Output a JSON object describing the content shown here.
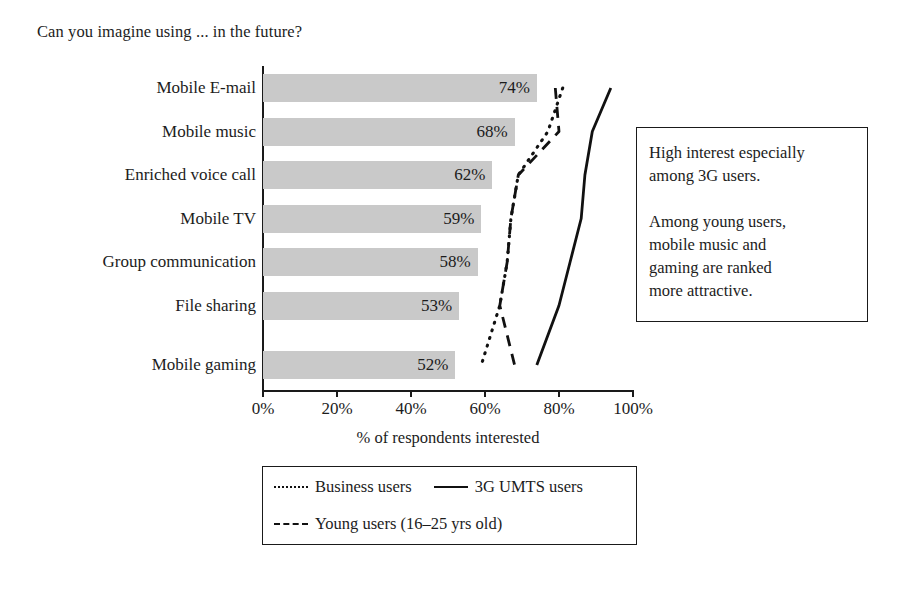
{
  "chart_title": "Can you imagine using ... in the future?",
  "axis": {
    "x_title": "% of respondents interested",
    "x_ticks": [
      "0%",
      "20%",
      "40%",
      "60%",
      "80%",
      "100%"
    ],
    "x_tick_values": [
      0,
      20,
      40,
      60,
      80,
      100
    ]
  },
  "annotation": {
    "paragraph_1": "High interest especially",
    "paragraph_2": "among 3G users.",
    "paragraph_3": "Among young users,",
    "paragraph_4": "mobile music and",
    "paragraph_5": "gaming are ranked",
    "paragraph_6": "more attractive."
  },
  "legend": {
    "items": [
      {
        "label": "Business users",
        "style": "dotted"
      },
      {
        "label": "3G UMTS users",
        "style": "solid"
      },
      {
        "label": "Young users (16–25 yrs old)",
        "style": "dashed"
      }
    ]
  },
  "colors": {
    "bar_fill": "#c9c9c9",
    "line": "#111111",
    "axis": "#1a1a1a",
    "text": "#1c1c1c",
    "background": "#ffffff"
  },
  "chart_data": {
    "type": "bar",
    "title": "Can you imagine using ... in the future?",
    "xlabel": "% of respondents interested",
    "ylabel": "",
    "xlim": [
      0,
      100
    ],
    "grid": false,
    "orientation": "horizontal",
    "legend_position": "below-axis",
    "categories": [
      "Mobile E-mail",
      "Mobile music",
      "Enriched voice call",
      "Mobile TV",
      "Group communication",
      "File sharing",
      "Mobile gaming"
    ],
    "values": [
      74,
      68,
      62,
      59,
      58,
      53,
      52
    ],
    "value_labels": [
      "74%",
      "68%",
      "62%",
      "59%",
      "58%",
      "53%",
      "52%"
    ],
    "series": [
      {
        "name": "All respondents (bars)",
        "style": "bar",
        "values": [
          74,
          68,
          62,
          59,
          58,
          53,
          52
        ]
      },
      {
        "name": "Business users",
        "style": "dotted",
        "values": [
          81,
          77,
          69,
          67,
          66,
          64,
          59
        ]
      },
      {
        "name": "3G UMTS users",
        "style": "solid",
        "values": [
          94,
          89,
          87,
          86,
          83,
          80,
          74
        ]
      },
      {
        "name": "Young users (16–25 yrs old)",
        "style": "dashed",
        "values": [
          79,
          80,
          69,
          67,
          66,
          64,
          68
        ]
      }
    ]
  }
}
